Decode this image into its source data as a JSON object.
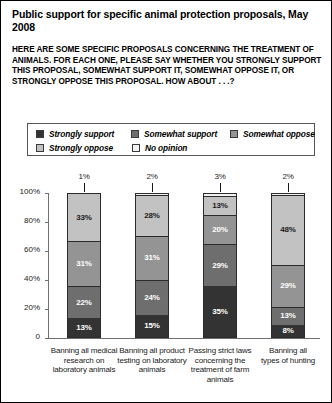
{
  "header": {
    "title": "Public support for specific animal protection proposals, May 2008",
    "subtitle": "HERE ARE SOME SPECIFIC PROPOSALS CONCERNING THE TREATMENT OF ANIMALS. FOR EACH ONE, PLEASE SAY WHETHER YOU STRONGLY SUPPORT THIS PROPOSAL, SOMEWHAT SUPPORT IT, SOMEWHAT OPPOSE IT, OR STRONGLY OPPOSE THIS PROPOSAL. HOW ABOUT . . .?"
  },
  "chart_data": {
    "type": "bar",
    "subtype": "stacked-column-100",
    "title": "Public support for specific animal protection proposals, May 2008",
    "subtitle": "HERE ARE SOME SPECIFIC PROPOSALS CONCERNING THE TREATMENT OF ANIMALS. FOR EACH ONE, PLEASE SAY WHETHER YOU STRONGLY SUPPORT THIS PROPOSAL, SOMEWHAT SUPPORT IT, SOMEWHAT OPPOSE IT, OR STRONGLY OPPOSE THIS PROPOSAL. HOW ABOUT . . .?",
    "xlabel": "",
    "ylabel": "",
    "ylim": [
      0,
      100
    ],
    "yticks": [
      "0",
      "20%",
      "40%",
      "60%",
      "80%",
      "100%"
    ],
    "ytick_values": [
      0,
      20,
      40,
      60,
      80,
      100
    ],
    "grid": false,
    "legend_position": "above-plot",
    "categories": [
      "Banning all medical research on laboratory animals",
      "Banning all product testing on laboratory animals",
      "Passing strict laws concerning the treatment of farm animals",
      "Banning all types of hunting"
    ],
    "series": [
      {
        "name": "Strongly support",
        "color": "#333333",
        "label_color": "#ffffff",
        "values": [
          13,
          15,
          35,
          8
        ],
        "labels": [
          "13%",
          "15%",
          "35%",
          "8%"
        ]
      },
      {
        "name": "Somewhat support",
        "color": "#6e6e6e",
        "label_color": "#ffffff",
        "values": [
          22,
          24,
          29,
          13
        ],
        "labels": [
          "22%",
          "24%",
          "29%",
          "13%"
        ]
      },
      {
        "name": "Somewhat oppose",
        "color": "#949494",
        "label_color": "#ffffff",
        "values": [
          31,
          31,
          20,
          29
        ],
        "labels": [
          "31%",
          "31%",
          "20%",
          "29%"
        ]
      },
      {
        "name": "Strongly oppose",
        "color": "#c2c2c2",
        "label_color": "#1a1a1a",
        "values": [
          33,
          28,
          13,
          48
        ],
        "labels": [
          "33%",
          "28%",
          "13%",
          "48%"
        ]
      },
      {
        "name": "No opinion",
        "color": "#f2f2f2",
        "label_color": "#1a1a1a",
        "values": [
          1,
          2,
          3,
          2
        ],
        "labels": [
          "1%",
          "2%",
          "3%",
          "2%"
        ],
        "labels_outside": true
      }
    ]
  },
  "legend": {
    "items": [
      {
        "label": "Strongly support",
        "color": "#333333"
      },
      {
        "label": "Somewhat support",
        "color": "#6e6e6e"
      },
      {
        "label": "Somewhat oppose",
        "color": "#949494"
      },
      {
        "label": "Strongly oppose",
        "color": "#c2c2c2"
      },
      {
        "label": "No opinion",
        "color": "#f2f2f2"
      }
    ]
  }
}
